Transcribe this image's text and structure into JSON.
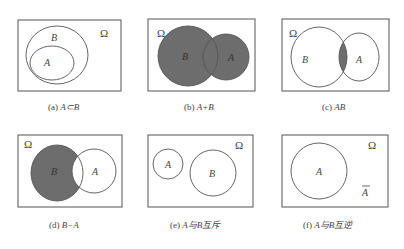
{
  "figure": {
    "universe_symbol": "Ω",
    "shade_color": "#6d6d6d",
    "stroke_color": "#555555",
    "panels": [
      {
        "id": "a",
        "caption_prefix": "(a) ",
        "caption_expr": "A⊂B",
        "labels": {
          "A": "A",
          "B": "B"
        },
        "relation": "A subset of B"
      },
      {
        "id": "b",
        "caption_prefix": "(b) ",
        "caption_expr": "A+B",
        "labels": {
          "A": "A",
          "B": "B"
        },
        "relation": "union shaded"
      },
      {
        "id": "c",
        "caption_prefix": "(c) ",
        "caption_expr": "AB",
        "labels": {
          "A": "A",
          "B": "B"
        },
        "relation": "intersection shaded"
      },
      {
        "id": "d",
        "caption_prefix": "(d) ",
        "caption_expr": "B−A",
        "labels": {
          "A": "A",
          "B": "B"
        },
        "relation": "difference shaded"
      },
      {
        "id": "e",
        "caption_prefix": "(e) ",
        "caption_expr": "A与B互斥",
        "labels": {
          "A": "A",
          "B": "B"
        },
        "relation": "mutually exclusive"
      },
      {
        "id": "f",
        "caption_prefix": "(f) ",
        "caption_expr": "A与B互逆",
        "labels": {
          "A": "A",
          "complement": "A"
        },
        "relation": "complementary"
      }
    ]
  }
}
